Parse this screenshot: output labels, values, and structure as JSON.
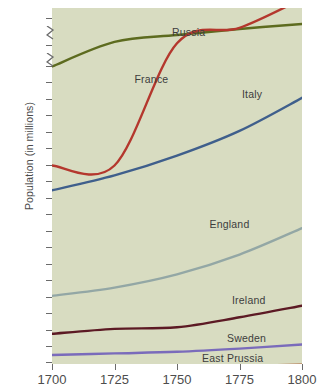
{
  "chart_data": {
    "type": "line",
    "title": "",
    "subtitle": "",
    "xlabel": "",
    "ylabel": "Population (in millions)",
    "xlim": [
      1700,
      1800
    ],
    "ylim": [
      0,
      40
    ],
    "grid": false,
    "legend_position": "inline-annotations",
    "xticks": [
      "1700",
      "1725",
      "1750",
      "1775",
      "1800"
    ],
    "yticks": [
      "1",
      "2",
      "3",
      "4",
      "5",
      "6",
      "7",
      "8",
      "9",
      "10",
      "11",
      "12",
      "13",
      "14",
      "15",
      "16",
      "17",
      "18",
      "19",
      "20",
      "30",
      "40"
    ],
    "y_axis_note": "broken axis: 1-20 linear, compressed breaks between 20-30 and 30-40",
    "x": [
      1700,
      1725,
      1750,
      1775,
      1800
    ],
    "series": [
      {
        "name": "Russia",
        "color": "#5d6b1f",
        "values": [
          19.0,
          21.5,
          24.0,
          26.2,
          28.0
        ],
        "label_x": 1748,
        "label_y": 24.6
      },
      {
        "name": "France",
        "color": "#b4372d",
        "values": [
          13.0,
          13.0,
          21.0,
          26.6,
          38.0
        ],
        "label_x": 1733,
        "label_y": 18.2
      },
      {
        "name": "Italy",
        "color": "#3f5f8c",
        "values": [
          11.5,
          12.4,
          13.6,
          15.1,
          17.1
        ],
        "label_x": 1776,
        "label_y": 17.3
      },
      {
        "name": "England",
        "color": "#93a7a5",
        "values": [
          5.1,
          5.6,
          6.4,
          7.6,
          9.2
        ],
        "label_x": 1763,
        "label_y": 9.4
      },
      {
        "name": "Ireland",
        "color": "#5c1a24",
        "values": [
          2.8,
          3.1,
          3.2,
          3.8,
          4.5
        ],
        "label_x": 1772,
        "label_y": 4.8
      },
      {
        "name": "Sweden",
        "color": "#7a6bbb",
        "values": [
          1.5,
          1.6,
          1.7,
          1.9,
          2.15
        ],
        "label_x": 1770,
        "label_y": 2.5
      },
      {
        "name": "East Prussia",
        "color": "#a8552b",
        "values": [
          0.5,
          0.55,
          0.65,
          0.8,
          0.9
        ],
        "label_x": 1760,
        "label_y": 1.25
      }
    ]
  },
  "axes": {
    "y_title": "Population (in millions)",
    "y_tick_labels": [
      "40",
      "30",
      "20",
      "19",
      "18",
      "17",
      "16",
      "15",
      "14",
      "13",
      "12",
      "11",
      "10",
      "9",
      "8",
      "7",
      "6",
      "5",
      "4",
      "3",
      "2",
      "1"
    ],
    "x_tick_labels": [
      "1700",
      "1725",
      "1750",
      "1775",
      "1800"
    ]
  },
  "annotations": {
    "russia": "Russia",
    "france": "France",
    "italy": "Italy",
    "england": "England",
    "ireland": "Ireland",
    "sweden": "Sweden",
    "east_prussia": "East Prussia"
  },
  "colors": {
    "plot_background": "#d8dcc1",
    "page_background": "#ffffff",
    "tick_color": "#6b6b6b",
    "text_color": "#4d4d4d"
  }
}
